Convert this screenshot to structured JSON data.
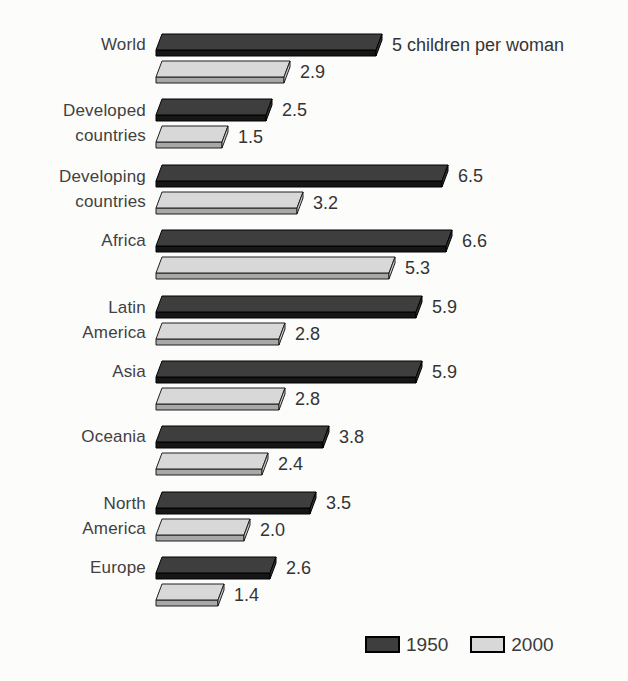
{
  "chart_data": {
    "type": "bar",
    "orientation": "horizontal",
    "title": "",
    "xlabel": "",
    "ylabel": "",
    "xlim": [
      0,
      7
    ],
    "grid": false,
    "legend_position": "bottom-right",
    "unit_annotation": "children per woman",
    "categories": [
      "World",
      "Developed countries",
      "Developing countries",
      "Africa",
      "Latin America",
      "Asia",
      "Oceania",
      "North America",
      "Europe"
    ],
    "categories_lines": [
      [
        "World"
      ],
      [
        "Developed",
        "countries"
      ],
      [
        "Developing",
        "countries"
      ],
      [
        "Africa"
      ],
      [
        "Latin",
        "America"
      ],
      [
        "Asia"
      ],
      [
        "Oceania"
      ],
      [
        "North",
        "America"
      ],
      [
        "Europe"
      ]
    ],
    "series": [
      {
        "name": "1950",
        "values": [
          5,
          2.5,
          6.5,
          6.6,
          5.9,
          5.9,
          3.8,
          3.5,
          2.6
        ],
        "labels": [
          "5 children per woman",
          "2.5",
          "6.5",
          "6.6",
          "5.9",
          "5.9",
          "3.8",
          "3.5",
          "2.6"
        ]
      },
      {
        "name": "2000",
        "values": [
          2.9,
          1.5,
          3.2,
          5.3,
          2.8,
          2.8,
          2.4,
          2.0,
          1.4
        ],
        "labels": [
          "2.9",
          "1.5",
          "3.2",
          "5.3",
          "2.8",
          "2.8",
          "2.4",
          "2.0",
          "1.4"
        ]
      }
    ]
  },
  "colors": {
    "background": "#fcfcfb",
    "series_1950": {
      "top": "#3e3e3e",
      "front": "#161616",
      "side": "#333333",
      "stroke": "#000000"
    },
    "series_2000": {
      "top": "#d8d8d8",
      "front": "#a8a8a8",
      "side": "#cccccc",
      "stroke": "#1f1f1f"
    },
    "label_text": "#414141",
    "value_text": "#343434"
  },
  "legend": {
    "items": [
      {
        "label": "1950"
      },
      {
        "label": "2000"
      }
    ]
  }
}
